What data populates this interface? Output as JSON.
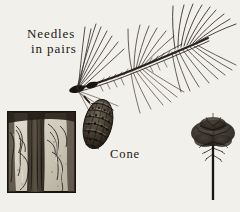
{
  "plate": {
    "subject": "pine-identification-plate",
    "medium": "pen-and-ink engraving",
    "background_color": "#f2f0ea",
    "ink_color": "#1a1713"
  },
  "labels": {
    "needles_line1": "Needles",
    "needles_line2": "in pairs",
    "cone": "Cone"
  },
  "figures": {
    "branch": {
      "name": "pine-branch-with-needle-sprays",
      "description": "diagonal twig from lower-left to upper-right bearing long fine needles in fascicles"
    },
    "cone": {
      "name": "pine-cone",
      "description": "elongated ovoid cone with stippled overlapping scales hanging at branch node"
    },
    "bark_panel": {
      "name": "bark-texture-panel",
      "description": "square block of furrowed bark with pale plates and dark vertical fissures",
      "scale_color": "#d9d4c8",
      "fissure_color": "#3b342c"
    },
    "tree_habit": {
      "name": "pine-tree-habit-silhouette",
      "description": "tall slender trunk with open tiered crown"
    }
  }
}
